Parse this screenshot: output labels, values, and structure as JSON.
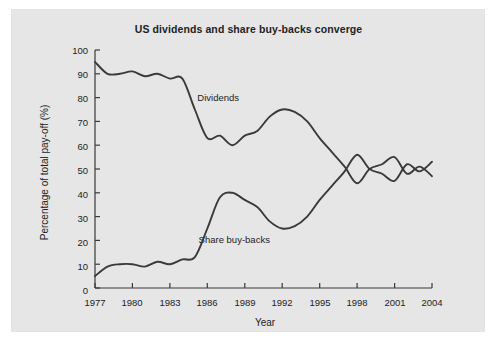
{
  "figure": {
    "background_color": "#ffffff",
    "panel_color": "#e6e6e6",
    "line_color": "#3a3a3a"
  },
  "chart_data": {
    "type": "line",
    "title": "US dividends and share buy-backs converge",
    "xlabel": "Year",
    "ylabel": "Percentage of total pay-off (%)",
    "xlim": [
      1977,
      2004
    ],
    "ylim": [
      0,
      100
    ],
    "grid": false,
    "legend_position": "inline-labels",
    "x_ticks": [
      1977,
      1980,
      1983,
      1986,
      1989,
      1992,
      1995,
      1998,
      2001,
      2004
    ],
    "y_ticks": [
      0,
      10,
      20,
      30,
      40,
      50,
      60,
      70,
      80,
      90,
      100
    ],
    "x": [
      1977,
      1978,
      1979,
      1980,
      1981,
      1982,
      1983,
      1984,
      1985,
      1986,
      1987,
      1988,
      1989,
      1990,
      1991,
      1992,
      1993,
      1994,
      1995,
      1996,
      1997,
      1998,
      1999,
      2000,
      2001,
      2002,
      2003,
      2004
    ],
    "series": [
      {
        "name": "Dividends",
        "label": "Dividends",
        "label_x": 1985.2,
        "label_y": 80,
        "values": [
          95,
          90,
          90,
          91,
          89,
          90,
          88,
          88,
          75,
          63,
          64,
          60,
          64,
          66,
          72,
          75,
          74,
          70,
          63,
          57,
          51,
          44,
          50,
          52,
          55,
          48,
          51,
          47
        ]
      },
      {
        "name": "Share buy-backs",
        "label": "Share buy-backs",
        "label_x": 1985.3,
        "label_y": 20,
        "values": [
          5,
          9,
          10,
          10,
          9,
          11,
          10,
          12,
          13,
          25,
          38,
          40,
          37,
          34,
          28,
          25,
          26,
          30,
          37,
          43,
          49,
          56,
          50,
          48,
          45,
          52,
          49,
          53
        ]
      }
    ],
    "annotations": [
      {
        "text": "Dividends",
        "x": 1985.2,
        "y": 80
      },
      {
        "text": "Share buy-backs",
        "x": 1985.3,
        "y": 20
      }
    ]
  }
}
